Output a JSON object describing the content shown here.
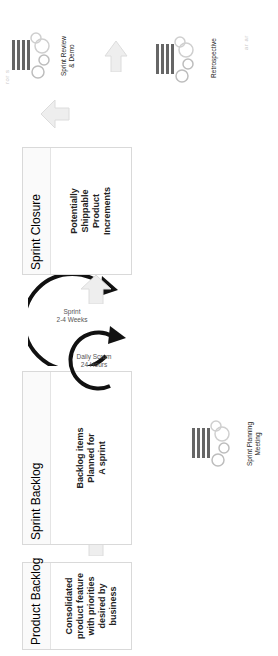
{
  "diagram": {
    "orientation": "rotated 90 degrees counter-clockwise",
    "boxes": [
      {
        "id": "product-backlog",
        "header": "Product Backlog",
        "body": "Consolidated\nproduct feature\nwith priorities\ndesired by\nbusiness"
      },
      {
        "id": "sprint-backlog",
        "header": "Sprint Backlog",
        "body": "Backlog items\nPlanned for\nA sprint"
      },
      {
        "id": "sprint-closure",
        "header": "Sprint Closure",
        "body": "Potentially\nShippable\nProduct\nIncrements"
      }
    ],
    "cycles": {
      "sprint": "Sprint\n2-4 Weeks",
      "daily_scrum": "Daily Scrum\n24 Hours"
    },
    "meetings": {
      "planning": "Sprint Planning\nMeeting",
      "review": "Sprint Review\n& Demo",
      "retrospective": "Retrospective"
    },
    "faint_marks": [
      "ror s",
      "ar ar"
    ],
    "colors": {
      "box_border": "#d9d9d9",
      "arrow_fill": "#eeeeee",
      "arrow_stroke": "#dcdcdc",
      "cycle_arrow": "#111111",
      "people_dark": "#555555",
      "gears": "#bdbdbd"
    }
  }
}
